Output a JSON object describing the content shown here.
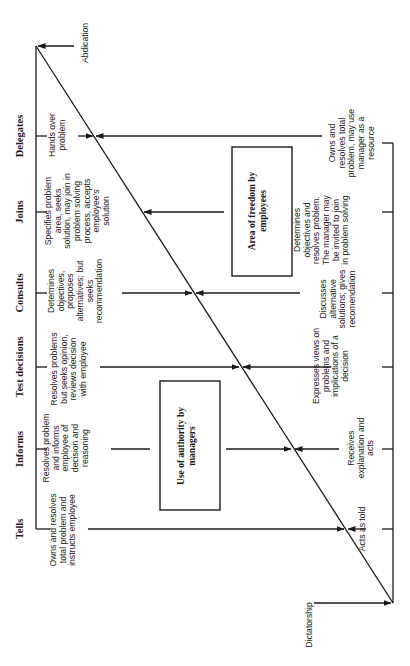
{
  "diagram": {
    "stages": [
      {
        "id": "tells",
        "header": "Tells",
        "manager_action": "Owns and resolves\ntotal problem and\ninstructs employee",
        "employee_action": "Acts as told"
      },
      {
        "id": "informs",
        "header": "Informs",
        "manager_action": "Resolves problem\nand informs\nemployee of\ndecision and\nreasoning",
        "employee_action": "Receives\nexplanation and\nacts"
      },
      {
        "id": "test-decisions",
        "header": "Test decisions",
        "manager_action": "Resolves problems\nbut seeks opinion,\nreviews decision\nwith employee",
        "employee_action": "Expresses views on\nproblems and\nimplications of a\ndecision"
      },
      {
        "id": "consults",
        "header": "Consults",
        "manager_action": "Determines\nobjectives,\nproposes\nalternatives; but\nseeks\nrecommendation",
        "employee_action": "Discusses\nalternative\nsolutions; gives\nrecomendation"
      },
      {
        "id": "joins",
        "header": "Joins",
        "manager_action": "Specifies problem\narea, seeks\nsolution, may join in\nproblem solving\nprocess, accepts\nemployee's\nsolution",
        "employee_action": "Determines\nobjectives and\nresolves problem.\nThe manager may\nbe invited to join\nin problem solving"
      },
      {
        "id": "delegates",
        "header": "Delegates",
        "manager_action": "Hands over\nproblem",
        "employee_action": "Owns and\nresolves total\nproblem, may use\nmanager as a\nresource"
      }
    ],
    "regions": {
      "manager": "Use of authority by\nmanagers",
      "employee": "Area of freedom by\nemployees"
    },
    "extremes": {
      "top": "Abdication",
      "bottom": "Dictatorship"
    },
    "colors": {
      "line": "#1a1a1a",
      "background": "#ffffff"
    }
  }
}
